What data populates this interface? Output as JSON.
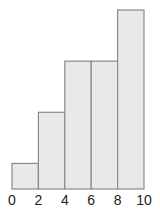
{
  "chart_data": {
    "type": "bar",
    "subtype": "histogram",
    "title": "",
    "xlabel": "",
    "ylabel": "",
    "bins": [
      {
        "start": 0,
        "end": 2,
        "value": 1
      },
      {
        "start": 2,
        "end": 4,
        "value": 3
      },
      {
        "start": 4,
        "end": 6,
        "value": 5
      },
      {
        "start": 6,
        "end": 8,
        "value": 5
      },
      {
        "start": 8,
        "end": 10,
        "value": 7
      }
    ],
    "categories": [
      "0-2",
      "2-4",
      "4-6",
      "6-8",
      "8-10"
    ],
    "values": [
      1,
      3,
      5,
      5,
      7
    ],
    "x_tick_labels": [
      "0",
      "2",
      "4",
      "6",
      "8",
      "10"
    ],
    "xlim": [
      0,
      10
    ],
    "ylim": [
      0,
      7
    ],
    "grid": false,
    "legend": null,
    "colors": {
      "bar_fill": "#e9e9e9",
      "bar_stroke": "#8a8a8a",
      "text": "#222222"
    }
  }
}
